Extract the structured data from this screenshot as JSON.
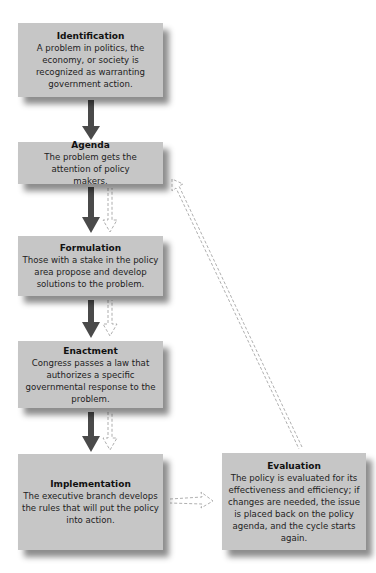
{
  "diagram": {
    "type": "flowchart",
    "colors": {
      "box_fill": "#c6c6c6",
      "solid_arrow": "#4a4a4a",
      "dashed_arrow": "#9a9a9a",
      "text": "#1a1a1a"
    },
    "steps": [
      {
        "title": "Identification",
        "description": "A problem in politics, the economy, or society is recognized as warranting government action."
      },
      {
        "title": "Agenda",
        "description": "The problem gets the attention of policy makers."
      },
      {
        "title": "Formulation",
        "description": "Those with a stake in the policy area propose and develop solutions to the problem."
      },
      {
        "title": "Enactment",
        "description": "Congress passes a law that authorizes a specific governmental response to the problem."
      },
      {
        "title": "Implementation",
        "description": "The executive branch develops the rules that will put the policy into action."
      },
      {
        "title": "Evaluation",
        "description": "The policy is evaluated for its effectiveness and efficiency; if changes are needed, the issue is placed back on the policy agenda, and the cycle starts again."
      }
    ],
    "connections": [
      {
        "from": "Identification",
        "to": "Agenda",
        "style": "solid"
      },
      {
        "from": "Agenda",
        "to": "Formulation",
        "style": "solid"
      },
      {
        "from": "Formulation",
        "to": "Agenda",
        "style": "dashed"
      },
      {
        "from": "Formulation",
        "to": "Enactment",
        "style": "solid"
      },
      {
        "from": "Enactment",
        "to": "Formulation",
        "style": "dashed"
      },
      {
        "from": "Enactment",
        "to": "Implementation",
        "style": "solid"
      },
      {
        "from": "Implementation",
        "to": "Enactment",
        "style": "dashed"
      },
      {
        "from": "Implementation",
        "to": "Evaluation",
        "style": "dashed"
      },
      {
        "from": "Evaluation",
        "to": "Agenda",
        "style": "dashed"
      }
    ]
  }
}
